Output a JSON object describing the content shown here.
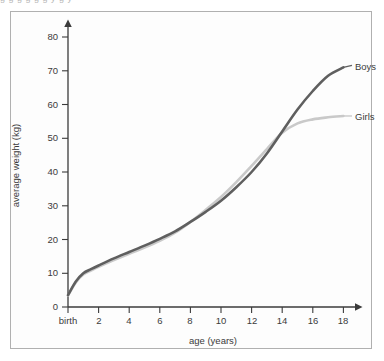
{
  "top_clipped_text": "g g g g g g y g y",
  "chart_data": {
    "type": "line",
    "title": "",
    "xlabel": "age (years)",
    "ylabel": "average weight (kg)",
    "xlim": [
      0,
      19.5
    ],
    "ylim": [
      0,
      84
    ],
    "grid": false,
    "legend_position": "inline-right",
    "x_tick_labels": [
      "birth",
      "2",
      "4",
      "6",
      "8",
      "10",
      "12",
      "14",
      "16",
      "18"
    ],
    "x_tick_values": [
      0,
      2,
      4,
      6,
      8,
      10,
      12,
      14,
      16,
      18
    ],
    "y_tick_labels": [
      "0",
      "10",
      "20",
      "30",
      "40",
      "50",
      "60",
      "70",
      "80"
    ],
    "y_tick_values": [
      0,
      10,
      20,
      30,
      40,
      50,
      60,
      70,
      80
    ],
    "x": [
      0,
      0.5,
      1,
      1.5,
      2,
      3,
      4,
      5,
      6,
      7,
      8,
      9,
      10,
      11,
      12,
      13,
      14,
      15,
      16,
      17,
      18
    ],
    "series": [
      {
        "name": "Boys",
        "color": "#5f5f5f",
        "label": "Boys",
        "values": [
          3.5,
          7.5,
          10.0,
          11.2,
          12.3,
          14.4,
          16.3,
          18.2,
          20.2,
          22.4,
          25.2,
          28.2,
          31.5,
          35.5,
          40.0,
          45.5,
          52.0,
          58.5,
          64.0,
          68.5,
          71.0
        ]
      },
      {
        "name": "Girls",
        "color": "#c9c9c9",
        "label": "Girls",
        "values": [
          3.4,
          7.2,
          9.6,
          10.8,
          11.9,
          13.9,
          15.8,
          17.6,
          19.6,
          22.0,
          25.2,
          28.8,
          32.6,
          37.0,
          41.8,
          46.8,
          51.6,
          54.4,
          55.6,
          56.2,
          56.6
        ]
      }
    ]
  },
  "axis": {
    "y_arrow": "up-arrow",
    "x_arrow": "right-arrow"
  }
}
